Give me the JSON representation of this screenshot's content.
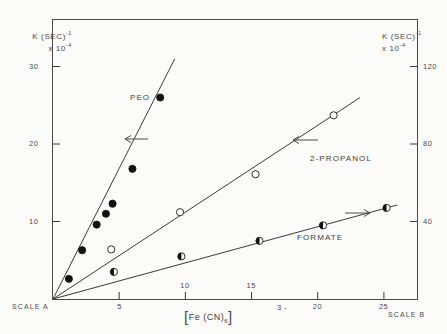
{
  "figure": {
    "background_color": "#fbfbf9",
    "ink_color": "#3a3a3a"
  },
  "axes": {
    "left": {
      "title_line1": "K (SEC)",
      "title_sup": "-1",
      "title_line2_prefix": "x 10",
      "title_line2_sup": "-4",
      "ticks": [
        "10",
        "20",
        "30"
      ],
      "scale_name": "SCALE A",
      "min": 0,
      "max": 36
    },
    "right": {
      "title_line1": "K (SEC)",
      "title_sup": "-1",
      "title_line2_prefix": "x 10",
      "title_line2_sup": "-4",
      "ticks": [
        "40",
        "80",
        "120"
      ],
      "scale_name": "SCALE B",
      "min": 0,
      "max": 144
    },
    "x": {
      "label_main": "Fe (CN)",
      "label_sub": "6",
      "label_charge": "3 -",
      "ticks": [
        "5",
        "10",
        "15",
        "20",
        "25"
      ],
      "min": 0,
      "max": 27.5
    }
  },
  "series_labels": {
    "peo": "PEO",
    "propanol": "2-PROPANOL",
    "formate": "FORMATE"
  },
  "chart_data": {
    "type": "scatter",
    "title": "",
    "xlabel": "[Fe (CN)6]3-",
    "ylabel": "K (SEC)-1 x 10-4",
    "xlim": [
      0,
      27.5
    ],
    "ylim_left": [
      0,
      36
    ],
    "ylim_right": [
      0,
      144
    ],
    "grid": false,
    "legend_position": "inline-annotations",
    "dual_axis": true,
    "axis_note": "Arrows indicate which vertical scale each series reads against: PEO and 2-PROPANOL point left (SCALE A); FORMATE points right (SCALE B).",
    "series": [
      {
        "name": "PEO",
        "marker": "filled-circle",
        "axis": "left",
        "arrow": "left",
        "points": [
          {
            "x": 1.2,
            "y": 2.6
          },
          {
            "x": 2.2,
            "y": 6.3
          },
          {
            "x": 3.3,
            "y": 9.6
          },
          {
            "x": 4.0,
            "y": 11.0
          },
          {
            "x": 4.5,
            "y": 12.3
          },
          {
            "x": 6.0,
            "y": 16.8
          },
          {
            "x": 8.1,
            "y": 26.0
          }
        ],
        "fit_line": {
          "x0": 0.0,
          "y0": 0.0,
          "x1": 9.2,
          "y1": 31.0
        }
      },
      {
        "name": "2-PROPANOL",
        "marker": "open-circle",
        "axis": "left",
        "arrow": "left",
        "points": [
          {
            "x": 4.4,
            "y": 6.4
          },
          {
            "x": 9.6,
            "y": 11.2
          },
          {
            "x": 15.3,
            "y": 16.1
          },
          {
            "x": 21.2,
            "y": 23.7
          }
        ],
        "fit_line": {
          "x0": 0.0,
          "y0": 0.0,
          "x1": 23.2,
          "y1": 26.0
        }
      },
      {
        "name": "FORMATE",
        "marker": "half-filled-circle",
        "axis": "right",
        "arrow": "right",
        "points": [
          {
            "x": 4.6,
            "y": 14.0
          },
          {
            "x": 9.7,
            "y": 22.0
          },
          {
            "x": 15.6,
            "y": 30.0
          },
          {
            "x": 20.4,
            "y": 38.0
          },
          {
            "x": 25.2,
            "y": 47.0
          }
        ],
        "fit_line": {
          "x0": 0.0,
          "y0": 0.0,
          "x1": 26.0,
          "y1": 48.5
        }
      }
    ]
  }
}
